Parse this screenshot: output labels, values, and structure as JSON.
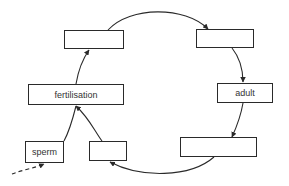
{
  "diagram": {
    "type": "life-cycle",
    "stroke_color": "#2a2a2a",
    "boxes": [
      {
        "id": "top-left",
        "label": "",
        "x": 64,
        "y": 30,
        "w": 60,
        "h": 19
      },
      {
        "id": "top-right",
        "label": "",
        "x": 196,
        "y": 29,
        "w": 58,
        "h": 19
      },
      {
        "id": "fertilisation",
        "label": "fertilisation",
        "x": 28,
        "y": 84,
        "w": 96,
        "h": 21
      },
      {
        "id": "adult",
        "label": "adult",
        "x": 217,
        "y": 83,
        "w": 56,
        "h": 20
      },
      {
        "id": "bottom-right",
        "label": "",
        "x": 180,
        "y": 137,
        "w": 77,
        "h": 20
      },
      {
        "id": "sperm",
        "label": "sperm",
        "x": 25,
        "y": 141,
        "w": 39,
        "h": 22
      },
      {
        "id": "bottom-middle",
        "label": "",
        "x": 89,
        "y": 141,
        "w": 38,
        "h": 20
      }
    ],
    "arrows": [
      {
        "from": "top-left",
        "to": "top-right",
        "style": "solid"
      },
      {
        "from": "top-right",
        "to": "adult",
        "style": "solid"
      },
      {
        "from": "adult",
        "to": "bottom-right",
        "style": "solid"
      },
      {
        "from": "bottom-right",
        "to": "bottom-middle",
        "style": "solid"
      },
      {
        "from": "bottom-middle",
        "to": "fertilisation",
        "style": "solid"
      },
      {
        "from": "sperm",
        "to": "fertilisation",
        "style": "solid"
      },
      {
        "from": "fertilisation",
        "to": "top-left",
        "style": "solid"
      },
      {
        "from": "outside",
        "to": "sperm",
        "style": "dashed"
      }
    ]
  }
}
